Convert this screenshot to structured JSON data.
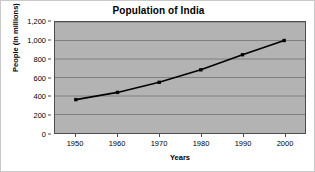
{
  "chart_data": {
    "type": "line",
    "title": "Population of India",
    "xlabel": "Years",
    "ylabel": "People (in millions)",
    "x": [
      1950,
      1960,
      1970,
      1980,
      1990,
      2000
    ],
    "xtick_labels": [
      "1950",
      "1960",
      "1970",
      "1980",
      "1990",
      "2000"
    ],
    "values": [
      361,
      439,
      548,
      683,
      846,
      1000
    ],
    "series": [
      {
        "name": "Population of India",
        "values": [
          361,
          439,
          548,
          683,
          846,
          1000
        ]
      }
    ],
    "ylim": [
      0,
      1200
    ],
    "xlim": [
      1945,
      2005
    ],
    "ytick_values": [
      0,
      200,
      400,
      600,
      800,
      1000,
      1200
    ],
    "ytick_labels": [
      "0",
      "200",
      "400",
      "600",
      "800",
      "1,000",
      "1,200"
    ],
    "grid": "horizontal",
    "legend": "none",
    "colors": {
      "plot_background": "#b3b3b3",
      "gridline": "#808080",
      "line": "#000000",
      "marker": "#000000",
      "axis": "#4d4d4d",
      "text": "#000000",
      "figure_background": "#ffffff"
    }
  }
}
